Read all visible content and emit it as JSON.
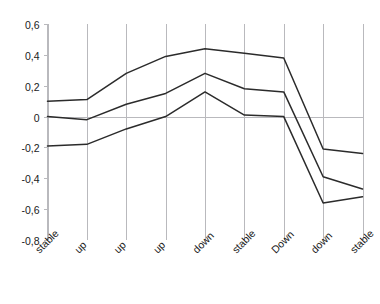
{
  "chart_data": {
    "type": "line",
    "title": "",
    "subtitle": "",
    "xlabel": "",
    "ylabel": "",
    "ylim": [
      -0.8,
      0.6
    ],
    "ytick_values": [
      0.6,
      0.4,
      0.2,
      0,
      -0.2,
      -0.4,
      -0.6,
      -0.8
    ],
    "ytick_labels": [
      "0,6",
      "0,4",
      "0,2",
      "0",
      "-0,2",
      "-0,4",
      "-0,6",
      "-0,8"
    ],
    "grid": "vertical-only",
    "legend": "none",
    "decimal_separator": ",",
    "categories": [
      "stable",
      "up",
      "up",
      "up",
      "down",
      "stable",
      "Down",
      "down",
      "stable"
    ],
    "series": [
      {
        "name": "upper",
        "values": [
          0.1,
          0.11,
          0.28,
          0.39,
          0.44,
          0.41,
          0.38,
          -0.21,
          -0.24
        ]
      },
      {
        "name": "middle",
        "values": [
          0.0,
          -0.02,
          0.08,
          0.15,
          0.28,
          0.18,
          0.16,
          -0.39,
          -0.47
        ]
      },
      {
        "name": "lower",
        "values": [
          -0.19,
          -0.18,
          -0.08,
          0.0,
          0.16,
          0.01,
          0.0,
          -0.56,
          -0.52
        ]
      }
    ]
  },
  "axes": {
    "y_axis_name": "value-axis",
    "x_axis_name": "category-axis"
  }
}
